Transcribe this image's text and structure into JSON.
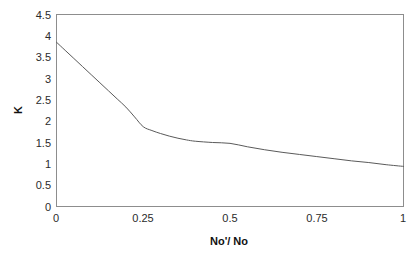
{
  "chart_data": {
    "type": "line",
    "title": "",
    "xlabel": "No'/ No",
    "ylabel": "K",
    "xlim": [
      0,
      1
    ],
    "ylim": [
      0,
      4.5
    ],
    "grid": false,
    "legend": null,
    "x_ticks": [
      "0",
      "0.25",
      "0.5",
      "0.75",
      "1"
    ],
    "x_tick_values": [
      0,
      0.25,
      0.5,
      0.75,
      1
    ],
    "y_ticks": [
      "0",
      "0.5",
      "1",
      "1.5",
      "2",
      "2.5",
      "3",
      "3.5",
      "4",
      "4.5"
    ],
    "y_tick_values": [
      0,
      0.5,
      1,
      1.5,
      2,
      2.5,
      3,
      3.5,
      4,
      4.5
    ],
    "series": [
      {
        "name": "K",
        "x": [
          0,
          0.025,
          0.05,
          0.075,
          0.1,
          0.125,
          0.15,
          0.175,
          0.2,
          0.225,
          0.25,
          0.275,
          0.3,
          0.325,
          0.35,
          0.375,
          0.4,
          0.45,
          0.5,
          0.55,
          0.6,
          0.65,
          0.7,
          0.75,
          0.8,
          0.85,
          0.9,
          0.95,
          1
        ],
        "values": [
          3.85,
          3.66,
          3.47,
          3.28,
          3.09,
          2.9,
          2.71,
          2.52,
          2.33,
          2.1,
          1.87,
          1.78,
          1.71,
          1.65,
          1.6,
          1.56,
          1.53,
          1.5,
          1.48,
          1.4,
          1.33,
          1.27,
          1.22,
          1.17,
          1.12,
          1.07,
          1.03,
          0.98,
          0.94
        ]
      }
    ],
    "colors": {
      "curve": "#5a5a5a",
      "frame": "#8d8d8d",
      "tick_text": "#2b2b2b",
      "background": "#ffffff"
    }
  }
}
